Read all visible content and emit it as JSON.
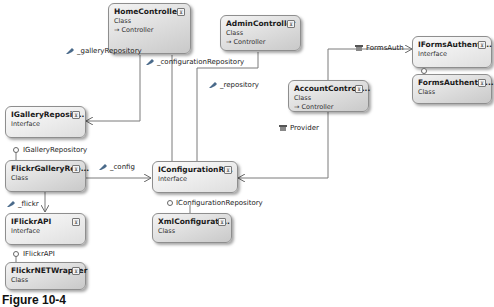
{
  "diagram": {
    "caption": "Figure 10-4",
    "classes": [
      {
        "id": "home",
        "name": "HomeController",
        "kind": "Class",
        "base": "→ Controller"
      },
      {
        "id": "admin",
        "name": "AdminController",
        "kind": "Class",
        "base": "→ Controller"
      },
      {
        "id": "account",
        "name": "AccountControll...",
        "kind": "Class",
        "base": "→ Controller"
      },
      {
        "id": "igallery",
        "name": "IGalleryReposit...",
        "kind": "Interface"
      },
      {
        "id": "flickrgallery",
        "name": "FlickrGalleryRep...",
        "kind": "Class"
      },
      {
        "id": "iflickr",
        "name": "IFlickrAPI",
        "kind": "Interface"
      },
      {
        "id": "flickrnet",
        "name": "FlickrNETWrapper",
        "kind": "Class"
      },
      {
        "id": "iconfig",
        "name": "IConfigurationR...",
        "kind": "Interface"
      },
      {
        "id": "xmlconfig",
        "name": "XmlConfigurati...",
        "kind": "Class"
      },
      {
        "id": "iforms",
        "name": "IFormsAuthenti...",
        "kind": "Interface"
      },
      {
        "id": "forms",
        "name": "FormsAuthentic...",
        "kind": "Class"
      }
    ],
    "associations": [
      {
        "label": "_galleryRepository",
        "icon": "field-icon"
      },
      {
        "label": "_configurationRepository",
        "icon": "field-icon"
      },
      {
        "label": "_repository",
        "icon": "field-icon"
      },
      {
        "label": "FormsAuth",
        "icon": "property-icon"
      },
      {
        "label": "Provider",
        "icon": "property-icon"
      },
      {
        "label": "_config",
        "icon": "field-icon"
      },
      {
        "label": "_flickr",
        "icon": "field-icon"
      }
    ],
    "implementations": [
      {
        "label": "IGalleryRepository"
      },
      {
        "label": "IFlickrAPI"
      },
      {
        "label": "IConfigurationRepository"
      }
    ],
    "toggle_glyph": "⊻"
  }
}
